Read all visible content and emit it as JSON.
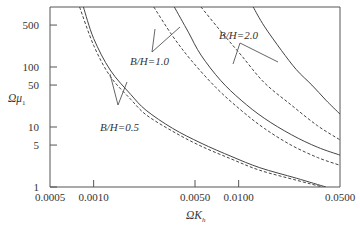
{
  "chart_data": {
    "type": "line",
    "title": "",
    "xlabel": "ΩK_h",
    "ylabel": "Ωμ_1",
    "xscale": "log",
    "yscale": "log",
    "xlim": [
      0.0005,
      0.05
    ],
    "ylim": [
      1,
      1000
    ],
    "grid": false,
    "x_ticks": [
      0.0005,
      0.001,
      0.005,
      0.01,
      0.05
    ],
    "x_tick_labels": [
      "0.0005",
      "0.0010",
      "0.0050",
      "0.0100",
      "0.0500"
    ],
    "y_ticks": [
      1,
      5,
      10,
      50,
      100,
      500
    ],
    "y_tick_labels": [
      "1",
      "5",
      "10",
      "50",
      "100",
      "500"
    ],
    "series": [
      {
        "name": "B/H=0.5 (solid)",
        "style": "solid",
        "x": [
          0.00085,
          0.001,
          0.0013,
          0.0018,
          0.0023,
          0.0035,
          0.0055,
          0.009,
          0.014,
          0.025,
          0.04
        ],
        "y": [
          1000,
          300,
          89,
          35,
          19,
          9.5,
          5.4,
          3.2,
          2.1,
          1.4,
          1.0
        ]
      },
      {
        "name": "B/H=0.5 (dashed)",
        "style": "dashed",
        "x": [
          0.0008,
          0.001,
          0.0013,
          0.0018,
          0.0023,
          0.0035,
          0.0055,
          0.009,
          0.014,
          0.025,
          0.038
        ],
        "y": [
          1000,
          230,
          70,
          29,
          16,
          8.5,
          4.8,
          2.9,
          1.9,
          1.3,
          1.0
        ]
      },
      {
        "name": "B/H=1.0 (solid)",
        "style": "solid",
        "x": [
          0.0036,
          0.0045,
          0.0055,
          0.0075,
          0.0104,
          0.015,
          0.0232,
          0.035,
          0.05
        ],
        "y": [
          1000,
          380,
          158,
          60,
          28,
          14,
          7.4,
          4.6,
          3.4
        ]
      },
      {
        "name": "B/H=1.0 (dashed)",
        "style": "dashed",
        "x": [
          0.0026,
          0.0035,
          0.0047,
          0.007,
          0.0104,
          0.015,
          0.023,
          0.035,
          0.05
        ],
        "y": [
          1000,
          330,
          130,
          45,
          19,
          9.5,
          5.0,
          3.1,
          2.3
        ]
      },
      {
        "name": "B/H=2.0 (solid)",
        "style": "solid",
        "x": [
          0.0126,
          0.015,
          0.0197,
          0.025,
          0.032,
          0.04,
          0.05
        ],
        "y": [
          1000,
          480,
          190,
          90,
          50,
          28,
          16.4
        ]
      },
      {
        "name": "B/H=2.0 (dashed)",
        "style": "dashed",
        "x": [
          0.0055,
          0.0075,
          0.0104,
          0.015,
          0.0232,
          0.035,
          0.05
        ],
        "y": [
          1000,
          400,
          158,
          55,
          23,
          10.5,
          6.1
        ]
      }
    ],
    "annotations": [
      {
        "text": "B/H=0.5",
        "x_px": 104,
        "y_px": 128
      },
      {
        "text": "B/H=1.0",
        "x_px": 130,
        "y_px": 63
      },
      {
        "text": "B/H=2.0",
        "x_px": 218,
        "y_px": 38
      }
    ]
  },
  "labels": {
    "annot_05": "B/H=0.5",
    "annot_10": "B/H=1.0",
    "annot_20": "B/H=2.0",
    "xlabel_main": "ΩK",
    "xlabel_sub": "h",
    "ylabel_main": "Ωμ",
    "ylabel_sub": "1"
  }
}
